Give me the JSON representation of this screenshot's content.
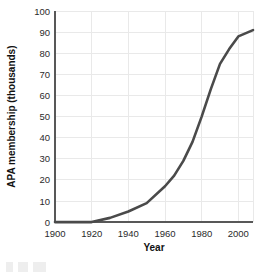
{
  "chart_data": {
    "type": "line",
    "title": "",
    "subtitle": "",
    "xlabel": "Year",
    "ylabel": "APA membership (thousands)",
    "xlim": [
      1900,
      2008
    ],
    "ylim": [
      0,
      100
    ],
    "xticks": [
      1900,
      1920,
      1940,
      1960,
      1980,
      2000
    ],
    "yticks": [
      0,
      10,
      20,
      30,
      40,
      50,
      60,
      70,
      80,
      90,
      100
    ],
    "xtick_labels": [
      "1900",
      "1920",
      "1940",
      "1960",
      "1980",
      "2000"
    ],
    "ytick_labels": [
      "0",
      "10",
      "20",
      "30",
      "40",
      "50",
      "60",
      "70",
      "80",
      "90",
      "100"
    ],
    "grid": true,
    "legend": null,
    "legend_position": "none",
    "series": [
      {
        "name": "APA membership",
        "color": "#4a4a4a",
        "x": [
          1900,
          1910,
          1920,
          1930,
          1940,
          1950,
          1960,
          1965,
          1970,
          1975,
          1980,
          1985,
          1990,
          1995,
          2000,
          2008
        ],
        "values": [
          0,
          0,
          0,
          2,
          5,
          9,
          17,
          22,
          29,
          38,
          50,
          63,
          75,
          82,
          88,
          91
        ]
      }
    ],
    "annotations": []
  },
  "figure": {
    "axis_color": "#585858",
    "grid_color": "#e9e9e9",
    "background": "#ffffff",
    "tick_text_color": "#2b2b2b",
    "axis_title_color": "#111111"
  }
}
